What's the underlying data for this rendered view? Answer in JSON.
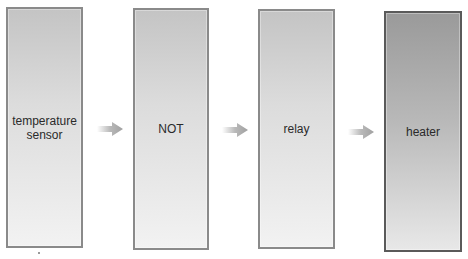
{
  "diagram": {
    "type": "flow",
    "direction": "left-to-right",
    "nodes": [
      {
        "id": "temperature-sensor",
        "label": "temperature\nsensor",
        "label_lines": [
          "temperature",
          "sensor"
        ],
        "style": "light"
      },
      {
        "id": "not",
        "label": "NOT",
        "style": "light"
      },
      {
        "id": "relay",
        "label": "relay",
        "style": "light"
      },
      {
        "id": "heater",
        "label": "heater",
        "style": "dark"
      }
    ],
    "edges": [
      {
        "from": "temperature-sensor",
        "to": "not",
        "icon": "arrow-right-icon"
      },
      {
        "from": "not",
        "to": "relay",
        "icon": "arrow-right-icon"
      },
      {
        "from": "relay",
        "to": "heater",
        "icon": "arrow-right-icon"
      }
    ],
    "colors": {
      "box_border": "#8a8a8a",
      "box_border_dark": "#5a5a5a",
      "arrow": "#a8a8a8",
      "text": "#2a2a2a"
    }
  }
}
